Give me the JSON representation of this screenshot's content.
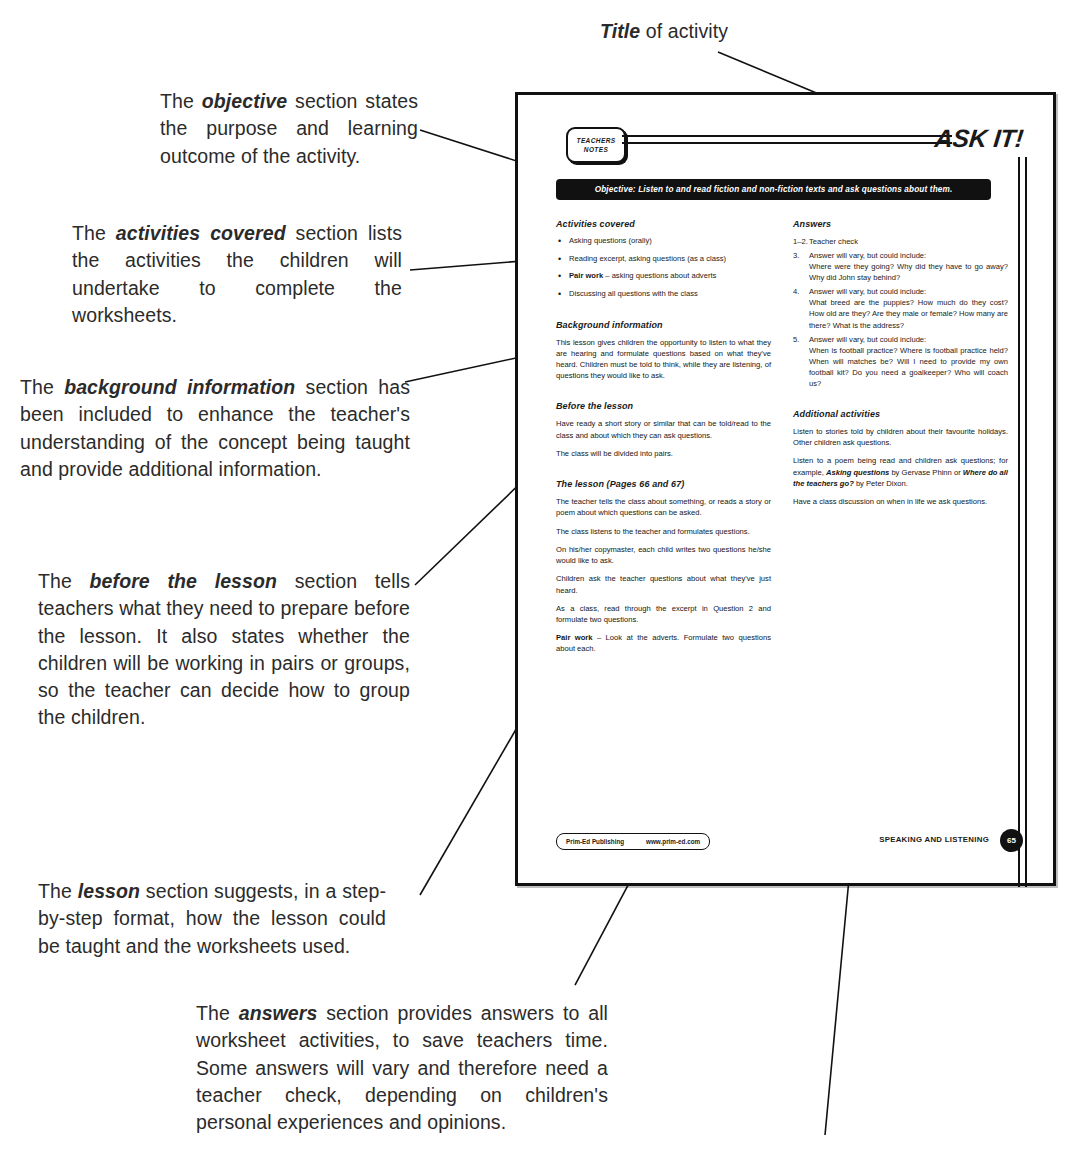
{
  "annotations": [
    {
      "id": "title-callout",
      "name": "annotation-title",
      "html": "<b>Title</b> of activity"
    },
    {
      "id": "objective-callout",
      "name": "annotation-objective",
      "html": "The <b>objective</b> section states the purpose and learning outcome of the activity."
    },
    {
      "id": "activities-callout",
      "name": "annotation-activities-covered",
      "html": "The <b>activities covered</b> section lists the activities the children will undertake to complete the worksheets."
    },
    {
      "id": "background-callout",
      "name": "annotation-background-information",
      "html": "The <b>background information</b> section has been included to enhance the teacher's understanding of the concept being taught and provide additional information."
    },
    {
      "id": "before-callout",
      "name": "annotation-before-the-lesson",
      "html": "The <b>before the lesson</b> section tells teachers what they need to prepare before the lesson. It also states whether the children will be working in pairs or groups, so the teacher can decide how to group the children."
    },
    {
      "id": "lesson-callout",
      "name": "annotation-lesson",
      "html": "The <b>lesson</b> section suggests, in a step-by-step format, how the lesson could be taught and the worksheets used."
    },
    {
      "id": "answers-callout",
      "name": "annotation-answers",
      "html": "The <b>answers</b> section provides answers to all worksheet activities, to save teachers time. Some answers will vary and therefore need a teacher check, depending on children's personal experiences and opinions."
    }
  ],
  "worksheet": {
    "badge_line1": "TEACHERS",
    "badge_line2": "NOTES",
    "title": "ASK IT!",
    "objective": "Objective:  Listen to and read fiction and non-fiction texts and ask questions about them.",
    "left_column": {
      "activities_heading": "Activities covered",
      "activities": [
        "Asking questions (orally)",
        "Reading excerpt, asking questions (as a class)",
        "<b>Pair work</b> – asking questions about adverts",
        "Discussing all questions with the class"
      ],
      "background_heading": "Background information",
      "background_text": "This lesson gives children the opportunity to listen to what they are hearing and formulate questions based on what they've heard. Children must be told to think, while they are listening, of questions they would like to ask.",
      "before_heading": "Before the lesson",
      "before_paragraphs": [
        "Have ready a short story or similar that can be told/read to the class and about which they can ask questions.",
        "The class will be divided into pairs."
      ],
      "lesson_heading": "The lesson (Pages 66 and 67)",
      "lesson_paragraphs": [
        "The teacher tells the class about something, or reads a story or poem about which questions can be asked.",
        "The class listens to the teacher and formulates questions.",
        "On his/her copymaster, each child writes two questions he/she would like to ask.",
        "Children ask the teacher questions about what they've just heard.",
        "As a class, read through the excerpt in Question 2 and formulate two questions.",
        "<b>Pair work</b> – Look at the adverts. Formulate two questions about each."
      ]
    },
    "right_column": {
      "answers_heading": "Answers",
      "answers": [
        {
          "num": "1–2.",
          "lead": "Teacher check",
          "examples": ""
        },
        {
          "num": "3.",
          "lead": "Answer will vary, but could include:",
          "examples": "Where were they going? Why did they have to go away? Why did John stay behind?"
        },
        {
          "num": "4.",
          "lead": "Answer will vary, but could include:",
          "examples": "What breed are the puppies? How much do they cost? How old are they? Are they male or female?  How many are there? What is the address?"
        },
        {
          "num": "5.",
          "lead": "Answer will vary, but could include:",
          "examples": "When is football practice? Where is football practice held? When will matches be? Will I need to provide my own football kit? Do you need a goalkeeper? Who will coach us?"
        }
      ],
      "additional_heading": "Additional activities",
      "additional_paragraphs": [
        "Listen to stories told by children about their favourite holidays. Other children ask questions.",
        "Listen to a poem being read and children ask questions; for example, <i><b>Asking questions</b></i> by Gervase Phinn or <i><b>Where do all the teachers go?</b></i> by Peter Dixon.",
        "Have a class discussion on when in life we ask questions."
      ]
    },
    "footer": {
      "publisher": "Prim-Ed Publishing",
      "website": "www.prim-ed.com",
      "strand": "SPEAKING AND LISTENING",
      "page_number": "65"
    }
  }
}
